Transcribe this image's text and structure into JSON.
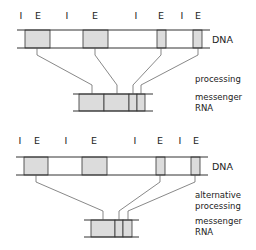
{
  "title": "",
  "panels": [
    {
      "name": "normal",
      "ie_labels": [
        {
          "t": "I",
          "x": 21
        },
        {
          "t": "E",
          "x": 38
        },
        {
          "t": "I",
          "x": 67
        },
        {
          "t": "E",
          "x": 95
        },
        {
          "t": "I",
          "x": 136
        },
        {
          "t": "E",
          "x": 161
        },
        {
          "t": "I",
          "x": 182
        },
        {
          "t": "E",
          "x": 198
        }
      ],
      "dna_label": "DNA",
      "process_label": [
        "processing"
      ],
      "mrna_label": [
        "messenger",
        "RNA"
      ],
      "exons_dna": [
        [
          25,
          50
        ],
        [
          83,
          108
        ],
        [
          157,
          166
        ],
        [
          193,
          202
        ]
      ],
      "mrna_exons": [
        [
          79,
          104
        ],
        [
          104,
          129
        ],
        [
          129,
          137
        ],
        [
          137,
          145
        ]
      ],
      "mrna_span": [
        73,
        153
      ],
      "links": [
        [
          37,
          92
        ],
        [
          95,
          117
        ],
        [
          161,
          133
        ],
        [
          198,
          141
        ]
      ]
    },
    {
      "name": "alternative",
      "ie_labels": [
        {
          "t": "I",
          "x": 20
        },
        {
          "t": "E",
          "x": 37
        },
        {
          "t": "I",
          "x": 66
        },
        {
          "t": "E",
          "x": 94
        },
        {
          "t": "I",
          "x": 135
        },
        {
          "t": "E",
          "x": 160
        },
        {
          "t": "I",
          "x": 180
        },
        {
          "t": "E",
          "x": 196
        }
      ],
      "dna_label": "DNA",
      "process_label": [
        "alternative",
        "processing"
      ],
      "mrna_label": [
        "messenger",
        "RNA"
      ],
      "exons_dna": [
        [
          24,
          48
        ],
        [
          82,
          107
        ],
        [
          156,
          165
        ],
        [
          191,
          200
        ]
      ],
      "mrna_exons": [
        [
          91,
          115
        ],
        [
          115,
          123
        ],
        [
          123,
          132
        ]
      ],
      "mrna_span": [
        84,
        139
      ],
      "links": [
        [
          36,
          103
        ],
        [
          160,
          119
        ],
        [
          195,
          128
        ]
      ]
    }
  ],
  "colors": {
    "exon": "#dcdcdc",
    "line": "#333333",
    "link": "#555555"
  }
}
